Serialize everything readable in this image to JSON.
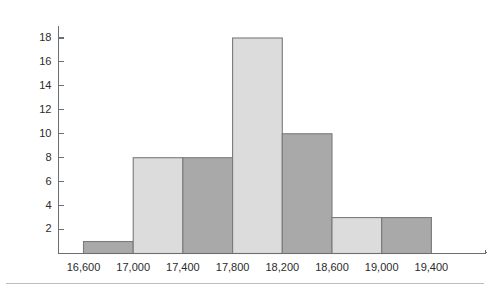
{
  "chart_data": {
    "type": "bar",
    "title": "",
    "subtitle": "",
    "xlabel": "x̄",
    "ylabel": "",
    "grid": false,
    "legend": null,
    "xtick_labels": [
      "16,600",
      "17,000",
      "17,400",
      "17,800",
      "18,200",
      "18,600",
      "19,000",
      "19,400"
    ],
    "ytick_labels": [
      "2",
      "4",
      "6",
      "8",
      "10",
      "12",
      "14",
      "16",
      "18"
    ],
    "ytick_values": [
      2,
      4,
      6,
      8,
      10,
      12,
      14,
      16,
      18
    ],
    "ylim": [
      0,
      19.6
    ],
    "xlim": [
      16400,
      19600
    ],
    "bin_width": 400,
    "bin_edges": [
      16600,
      17000,
      17400,
      17800,
      18200,
      18600,
      19000,
      19400
    ],
    "categories": [
      "16,600–17,000",
      "17,000–17,400",
      "17,400–17,800",
      "17,800–18,200",
      "18,200–18,600",
      "18,600–19,000",
      "19,000–19,400"
    ],
    "values": [
      1,
      8,
      8,
      18,
      10,
      3,
      3
    ],
    "bar_colors": [
      "#a9a9a9",
      "#dcdcdc",
      "#a9a9a9",
      "#dcdcdc",
      "#a9a9a9",
      "#dcdcdc",
      "#a9a9a9"
    ],
    "bar_edge_color": "#7a7a7a",
    "axis_color": "#6e6e6e",
    "background_color": "#ffffff",
    "text_color": "#2b2b2b"
  }
}
